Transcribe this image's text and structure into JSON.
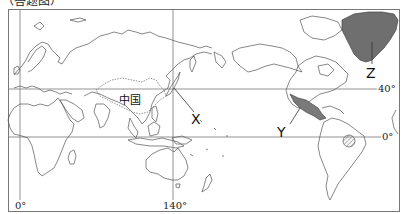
{
  "caption": "（答题图）",
  "map": {
    "type": "world-map-pacific-centered",
    "meridians": [
      {
        "label": "0°",
        "x": 20
      },
      {
        "label": "140°",
        "x": 173
      }
    ],
    "parallels": [
      {
        "label": "40°",
        "y": 89
      },
      {
        "label": "0°",
        "y": 137
      }
    ],
    "region_labels": {
      "china": "中国",
      "x": "X",
      "y": "Y",
      "z": "Z"
    },
    "colors": {
      "land_outline": "#555555",
      "grid_line": "#777777",
      "greenland_fill": "#6f6f6f",
      "mexico_fill": "#7a7a7a",
      "hatch": "#666666"
    }
  }
}
